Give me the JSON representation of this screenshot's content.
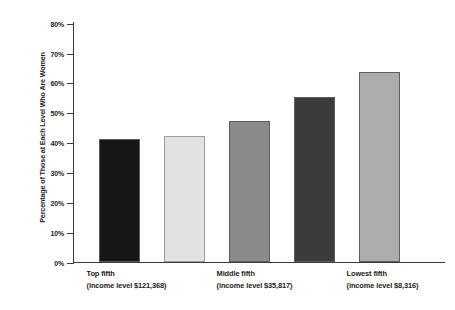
{
  "chart_data": {
    "type": "bar",
    "title": "",
    "xlabel": "",
    "ylabel": "Percentage of Those at Each Level Who Are Women",
    "ylim": [
      0,
      80
    ],
    "grid": false,
    "legend": null,
    "ytick_labels": [
      "80%",
      "70%",
      "60%",
      "50%",
      "40%",
      "30%",
      "20%",
      "10%",
      "0%"
    ],
    "ytick_values": [
      80,
      70,
      60,
      50,
      40,
      30,
      20,
      10,
      0
    ],
    "categories": [
      "Top fifth (income level $121,368)",
      "",
      "Middle fifth (income level $35,817)",
      "",
      "Lowest fifth (income level $8,316)"
    ],
    "values": [
      41,
      42,
      47,
      55,
      63.5
    ],
    "bar_colors": [
      "#161616",
      "#e2e2e2",
      "#8a8a8a",
      "#3b3b3b",
      "#adadad"
    ],
    "axis_color": "#3a3a3a"
  },
  "axis": {
    "ticks": [
      {
        "label": "80%",
        "value": 80
      },
      {
        "label": "70%",
        "value": 70
      },
      {
        "label": "60%",
        "value": 60
      },
      {
        "label": "50%",
        "value": 50
      },
      {
        "label": "40%",
        "value": 40
      },
      {
        "label": "30%",
        "value": 30
      },
      {
        "label": "20%",
        "value": 20
      },
      {
        "label": "10%",
        "value": 10
      },
      {
        "label": "0%",
        "value": 0
      }
    ],
    "y_title": "Percentage of Those at Each Level Who Are Women"
  },
  "category_labels": [
    {
      "line1": "Top fifth",
      "line2": "(income level $121,368)"
    },
    {
      "line1": "Middle fifth",
      "line2": "(income level $35,817)"
    },
    {
      "line1": "Lowest fifth",
      "line2": "(income level $8,316)"
    }
  ]
}
